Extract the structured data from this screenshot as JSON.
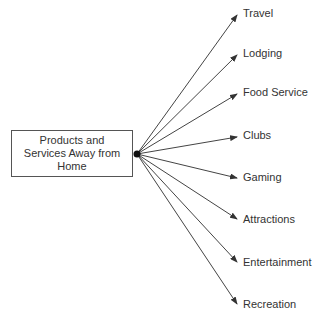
{
  "diagram": {
    "root": {
      "line1": "Products and",
      "line2": "Services Away from",
      "line3": "Home"
    },
    "hub": {
      "x": 137,
      "y": 154
    },
    "branches": [
      {
        "label": "Travel",
        "tip_x": 237,
        "tip_y": 15,
        "label_x": 243,
        "label_y": 7
      },
      {
        "label": "Lodging",
        "tip_x": 237,
        "tip_y": 55,
        "label_x": 243,
        "label_y": 47
      },
      {
        "label": "Food Service",
        "tip_x": 237,
        "tip_y": 94,
        "label_x": 243,
        "label_y": 86
      },
      {
        "label": "Clubs",
        "tip_x": 237,
        "tip_y": 137,
        "label_x": 243,
        "label_y": 129
      },
      {
        "label": "Gaming",
        "tip_x": 237,
        "tip_y": 178,
        "label_x": 243,
        "label_y": 171
      },
      {
        "label": "Attractions",
        "tip_x": 237,
        "tip_y": 219,
        "label_x": 243,
        "label_y": 213
      },
      {
        "label": "Entertainment",
        "tip_x": 237,
        "tip_y": 262,
        "label_x": 243,
        "label_y": 256
      },
      {
        "label": "Recreation",
        "tip_x": 237,
        "tip_y": 304,
        "label_x": 243,
        "label_y": 298
      }
    ],
    "colors": {
      "line": "#444444",
      "text": "#333333",
      "box_border": "#555555"
    }
  }
}
